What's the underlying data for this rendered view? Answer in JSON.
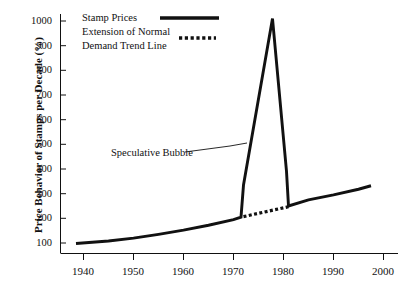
{
  "chart_data": {
    "type": "line",
    "title": "",
    "subtitle": "",
    "xlabel": "",
    "ylabel": "Price Behavior of Stamps per Decade (%)",
    "xlim": [
      1936,
      2002
    ],
    "ylim": [
      60,
      1040
    ],
    "xticks": [
      1940,
      1950,
      1960,
      1970,
      1980,
      1990,
      2000
    ],
    "yticks": [
      100,
      200,
      300,
      400,
      500,
      600,
      700,
      800,
      900,
      1000
    ],
    "grid": false,
    "legend_position": "top-left",
    "series": [
      {
        "name": "Stamp Prices",
        "style": "solid",
        "color": "#111111",
        "points": [
          [
            1938.5,
            98
          ],
          [
            1945,
            108
          ],
          [
            1950,
            120
          ],
          [
            1955,
            135
          ],
          [
            1960,
            152
          ],
          [
            1965,
            172
          ],
          [
            1970,
            195
          ],
          [
            1971.5,
            205
          ],
          [
            1972.0,
            335
          ],
          [
            1977.8,
            1010
          ],
          [
            1980.6,
            390
          ],
          [
            1981.0,
            250
          ],
          [
            1985,
            275
          ],
          [
            1990,
            295
          ],
          [
            1995,
            318
          ],
          [
            1997.5,
            332
          ]
        ]
      },
      {
        "name": "Extension of Normal Demand Trend Line",
        "style": "dotted",
        "color": "#111111",
        "points": [
          [
            1972.0,
            207
          ],
          [
            1981.0,
            247
          ]
        ]
      }
    ],
    "annotations": [
      {
        "text": "Speculative Bubble",
        "target_x": 1975.2,
        "target_y": 520
      }
    ],
    "legend_entries": [
      {
        "label_lines": [
          "Stamp Prices"
        ],
        "style": "solid"
      },
      {
        "label_lines": [
          "Extension of Normal",
          "Demand Trend Line"
        ],
        "style": "dotted"
      }
    ]
  },
  "axes": {
    "y_title": "Price Behavior of Stamps per Decade (%)",
    "y_tick_labels": [
      "1000",
      "900",
      "800",
      "700",
      "600",
      "500",
      "400",
      "300",
      "200",
      "100"
    ],
    "x_tick_labels": [
      "1940",
      "1950",
      "1960",
      "1970",
      "1980",
      "1990",
      "2000"
    ]
  },
  "legend": {
    "entry1_label": "Stamp Prices",
    "entry2_line1": "Extension of Normal",
    "entry2_line2": "Demand Trend Line"
  },
  "annotation": {
    "speculative_bubble": "Speculative Bubble"
  },
  "colors": {
    "ink": "#111111",
    "background": "#ffffff"
  }
}
